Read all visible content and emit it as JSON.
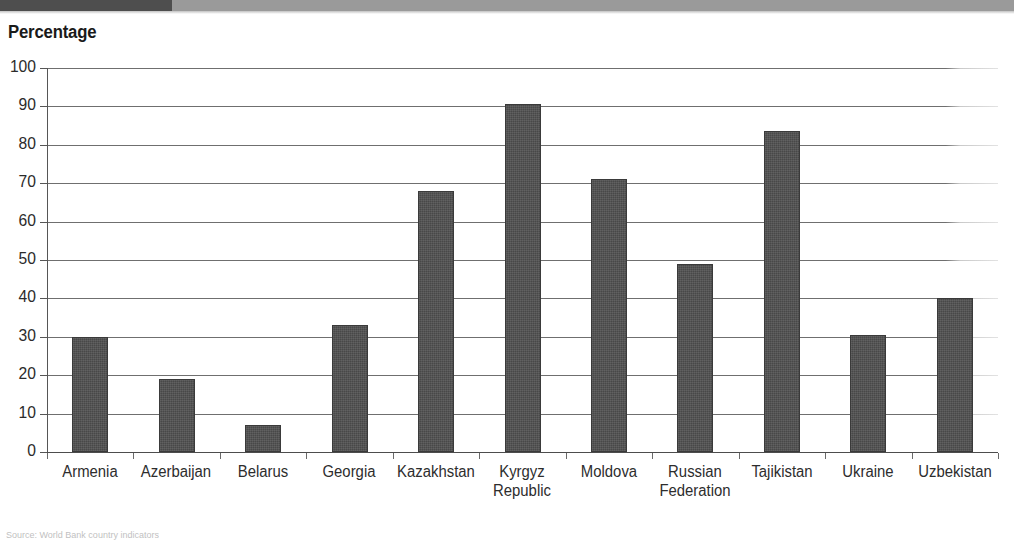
{
  "page": {
    "header_band_color": "#9a9a9a",
    "header_band_dark_color": "#4e4e4e",
    "source_caption": "Source: World Bank country indicators"
  },
  "chart_data": {
    "type": "bar",
    "title": "Percentage",
    "xlabel": "",
    "ylabel": "",
    "ylim": [
      0,
      100
    ],
    "ytick_step": 10,
    "grid": true,
    "legend": "none",
    "bar_color": "#4f4f4f",
    "categories": [
      "Armenia",
      "Azerbaijan",
      "Belarus",
      "Georgia",
      "Kazakhstan",
      "Kyrgyz\nRepublic",
      "Moldova",
      "Russian\nFederation",
      "Tajikistan",
      "Ukraine",
      "Uzbekistan"
    ],
    "values": [
      30,
      19,
      7,
      33,
      68,
      90.5,
      71,
      49,
      83.5,
      30.5,
      40
    ],
    "ytick_labels": [
      "100",
      "90",
      "80",
      "70",
      "60",
      "50",
      "40",
      "30",
      "20",
      "10",
      "0"
    ]
  }
}
